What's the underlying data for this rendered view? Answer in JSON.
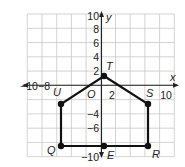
{
  "diagram": {
    "type": "coordinate-plane-polygon",
    "axes": {
      "x_label": "x",
      "y_label": "y",
      "origin_label": "O",
      "x_range": [
        -10,
        10
      ],
      "y_range": [
        -10,
        10
      ],
      "grid_step": 2,
      "x_tick_labels": [
        {
          "text": "−10",
          "x": 20,
          "y": 90
        },
        {
          "text": "−8",
          "x": 38,
          "y": 90
        },
        {
          "text": "2",
          "x": 112,
          "y": 99
        },
        {
          "text": "10",
          "x": 166,
          "y": 99
        }
      ],
      "y_tick_labels": [
        {
          "text": "10",
          "x": 99,
          "y": 20
        },
        {
          "text": "8",
          "x": 99,
          "y": 33
        },
        {
          "text": "6",
          "x": 99,
          "y": 47
        },
        {
          "text": "4",
          "x": 99,
          "y": 61
        },
        {
          "text": "2",
          "x": 99,
          "y": 75
        },
        {
          "text": "−4",
          "x": 99,
          "y": 118
        },
        {
          "text": "−6",
          "x": 99,
          "y": 132
        },
        {
          "text": "−10",
          "x": 99,
          "y": 161
        }
      ]
    },
    "polygon_order": [
      "T",
      "S",
      "R",
      "E",
      "Q",
      "U"
    ],
    "vertices": [
      {
        "name": "T",
        "coord": [
          0.5,
          1.5
        ],
        "px": [
          104,
          76
        ],
        "label_pos": [
          106,
          70
        ]
      },
      {
        "name": "S",
        "coord": [
          6.5,
          -2.5
        ],
        "px": [
          148,
          104
        ],
        "label_pos": [
          146,
          97
        ]
      },
      {
        "name": "R",
        "coord": [
          6.5,
          -8.5
        ],
        "px": [
          148,
          146
        ],
        "label_pos": [
          152,
          158
        ]
      },
      {
        "name": "E",
        "coord": [
          0.5,
          -8.5
        ],
        "px": [
          104,
          146
        ],
        "label_pos": [
          107,
          159
        ]
      },
      {
        "name": "Q",
        "coord": [
          -5.5,
          -8.5
        ],
        "px": [
          61,
          146
        ],
        "label_pos": [
          47,
          154
        ]
      },
      {
        "name": "U",
        "coord": [
          -5.5,
          -2.5
        ],
        "px": [
          61,
          104
        ],
        "label_pos": [
          53,
          96
        ]
      }
    ],
    "colors": {
      "grid": "#c8c8c8",
      "axis": "#222222",
      "polygon": "#111111",
      "background": "#ffffff"
    }
  }
}
